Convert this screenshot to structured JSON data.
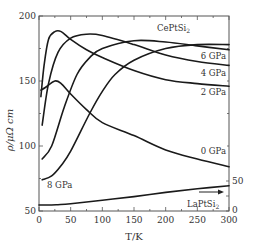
{
  "chart_data": {
    "type": "line",
    "title": "",
    "xlabel": "T/K",
    "ylabel": "ρ/μΩ cm",
    "xlim": [
      0,
      300
    ],
    "ylim": [
      50,
      200
    ],
    "y2lim": [
      0,
      50
    ],
    "x_ticks": [
      0,
      50,
      100,
      150,
      200,
      250,
      300
    ],
    "y_ticks": [
      50,
      100,
      150,
      200
    ],
    "y2_ticks": [
      0,
      50
    ],
    "grid": false,
    "annotations": [
      {
        "text": "CePtSi₂",
        "x": 240,
        "y": 192
      },
      {
        "text": "6 GPa",
        "x": 283,
        "y": 169
      },
      {
        "text": "4 GPa",
        "x": 283,
        "y": 161
      },
      {
        "text": "2 GPa",
        "x": 283,
        "y": 147
      },
      {
        "text": "0 GPa",
        "x": 283,
        "y": 96
      },
      {
        "text": "8 GPa",
        "x": 25,
        "y": 66
      },
      {
        "text": "LaPtSi₂",
        "x": 260,
        "y": 55
      },
      {
        "text": "→ (right axis)",
        "x": 265,
        "y": 63
      }
    ],
    "series": [
      {
        "name": "0 GPa",
        "axis": "left",
        "x": [
          3,
          10,
          25,
          35,
          50,
          75,
          100,
          150,
          200,
          250,
          300
        ],
        "y": [
          143,
          145,
          150,
          148,
          140,
          128,
          118,
          108,
          97,
          90,
          84
        ]
      },
      {
        "name": "2 GPa",
        "axis": "left",
        "x": [
          3,
          8,
          15,
          25,
          35,
          50,
          75,
          100,
          150,
          200,
          250,
          300
        ],
        "y": [
          138,
          162,
          182,
          188,
          188,
          182,
          174,
          168,
          158,
          151,
          148,
          146
        ]
      },
      {
        "name": "4 GPa",
        "axis": "left",
        "x": [
          5,
          15,
          30,
          50,
          75,
          100,
          150,
          200,
          250,
          300
        ],
        "y": [
          116,
          148,
          172,
          183,
          186,
          185,
          178,
          170,
          165,
          162
        ]
      },
      {
        "name": "6 GPa",
        "axis": "left",
        "x": [
          5,
          20,
          40,
          60,
          80,
          100,
          150,
          200,
          250,
          300
        ],
        "y": [
          90,
          100,
          130,
          155,
          168,
          175,
          181,
          180,
          177,
          174
        ]
      },
      {
        "name": "8 GPa",
        "axis": "left",
        "x": [
          5,
          20,
          35,
          50,
          80,
          100,
          120,
          150,
          200,
          250,
          300
        ],
        "y": [
          74,
          77,
          85,
          96,
          125,
          142,
          155,
          166,
          175,
          178,
          178
        ]
      },
      {
        "name": "LaPtSi₂",
        "axis": "right",
        "x": [
          0,
          20,
          30,
          50,
          100,
          150,
          200,
          250,
          300
        ],
        "y": [
          10,
          10,
          10.5,
          12,
          18,
          24,
          31,
          37,
          42
        ]
      }
    ]
  },
  "labels": {
    "ylabel": "ρ/μΩ cm",
    "xlabel": "T/K",
    "compound": "CePtSi",
    "compound_sub": "2",
    "ref": "LaPtSi",
    "ref_sub": "2"
  }
}
